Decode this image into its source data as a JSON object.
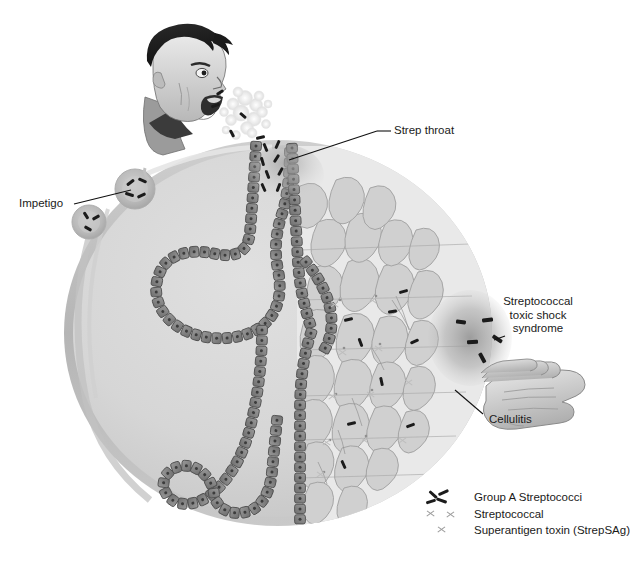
{
  "figure": {
    "title_fragment_top": ""
  },
  "callouts": [
    {
      "id": "strep-throat",
      "label": "Strep throat"
    },
    {
      "id": "impetigo",
      "label": "Impetigo"
    },
    {
      "id": "tss",
      "label": "Streptococcal\ntoxic shock\nsyndrome"
    },
    {
      "id": "cellulitis",
      "label": "Cellulitis"
    }
  ],
  "legend": {
    "items": [
      {
        "id": "group-a-strep",
        "marker": "bacteria-rods-icon",
        "label": "Group A Streptococci"
      },
      {
        "id": "strep-sag-1",
        "marker": "toxin-x-icon",
        "label": "Streptococcal"
      },
      {
        "id": "strep-sag-2",
        "marker": "toxin-x-icon",
        "label": "Superantigen toxin (StrepSAg)"
      }
    ]
  },
  "scene": {
    "person": "coughing-man-profile-icon",
    "droplets": "respiratory-droplet-spray",
    "hand": "inflamed-hand-icon",
    "body": "circular-body-cross-section",
    "epithelium": "epithelial-cell-chain",
    "tissue": "connective-tissue-network"
  },
  "colors": {
    "background": "#ffffff",
    "body_fill": "#d4d4d4",
    "body_rim": "#bdbdbd",
    "cell_fill": "#8c8c8c",
    "cell_stroke": "#5c5c5c",
    "tissue_fill": "#cfcfcf",
    "bacteria": "#1b1b1b",
    "toxin": "#bdbdbd",
    "text": "#1a1a1a",
    "leader_line": "#111111"
  }
}
